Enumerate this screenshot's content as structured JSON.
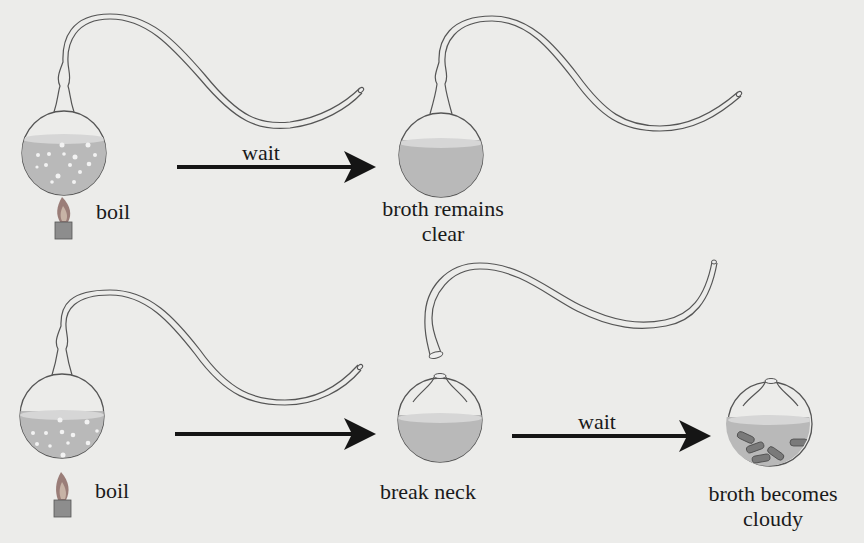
{
  "diagram": {
    "type": "process-diagram",
    "colors": {
      "background": "#ececea",
      "broth": "#b9b9b9",
      "broth_surface": "#d6d6d6",
      "glass_outline": "#555555",
      "arrow": "#151515",
      "bacteria": "#7a7a7a",
      "flame_outer": "#9a7d78",
      "flame_inner": "#c7b3a6",
      "burner": "#8d8d8d"
    },
    "rows": [
      {
        "id": "top",
        "steps": [
          {
            "flask": "swan-neck",
            "state": "boiling",
            "label": "boil",
            "heat": true
          },
          {
            "arrow_label": "wait"
          },
          {
            "flask": "swan-neck",
            "state": "clear",
            "label_line1": "broth remains",
            "label_line2": "clear"
          }
        ]
      },
      {
        "id": "bottom",
        "steps": [
          {
            "flask": "swan-neck",
            "state": "boiling",
            "label": "boil",
            "heat": true
          },
          {
            "arrow_label": ""
          },
          {
            "flask": "broken-neck",
            "state": "clear",
            "label": "break neck"
          },
          {
            "arrow_label": "wait"
          },
          {
            "flask": "broken-neck",
            "state": "cloudy",
            "label_line1": "broth becomes",
            "label_line2": "cloudy"
          }
        ]
      }
    ]
  },
  "labels": {
    "top_boil": "boil",
    "top_wait": "wait",
    "top_result_1": "broth remains",
    "top_result_2": "clear",
    "bottom_boil": "boil",
    "bottom_break": "break neck",
    "bottom_wait": "wait",
    "bottom_result_1": "broth becomes",
    "bottom_result_2": "cloudy"
  }
}
